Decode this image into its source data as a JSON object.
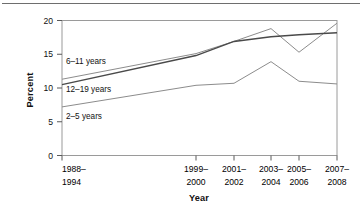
{
  "figure": {
    "name": "obesity-prevalence-line-chart",
    "top_rule": true,
    "background_color": "#ffffff"
  },
  "axes": {
    "x_title": "Year",
    "y_title": "Percent",
    "y_ticks": [
      "0",
      "5",
      "10",
      "15",
      "20"
    ],
    "x_ticks": [
      {
        "line1": "1988–",
        "line2": "1994"
      },
      {
        "line1": "1999–",
        "line2": "2000"
      },
      {
        "line1": "2001–",
        "line2": "2002"
      },
      {
        "line1": "2003–",
        "line2": "2004"
      },
      {
        "line1": "2005–",
        "line2": "2006"
      },
      {
        "line1": "2007–",
        "line2": "2008"
      }
    ]
  },
  "series_labels": {
    "s6_11": "6–11 years",
    "s12_19": "12–19 years",
    "s2_5": "2–5 years"
  },
  "chart_data": {
    "type": "line",
    "title": "",
    "xlabel": "Year",
    "ylabel": "Percent",
    "ylim": [
      0,
      20
    ],
    "yticks": [
      0,
      5,
      10,
      15,
      20
    ],
    "grid": false,
    "legend": "inline-labels-left",
    "categories": [
      "1988–1994",
      "1999–2000",
      "2001–2002",
      "2003–2004",
      "2005–2006",
      "2007–2008"
    ],
    "x_positions": [
      0,
      6.7,
      8.6,
      10.45,
      11.85,
      13.7
    ],
    "series": [
      {
        "name": "6–11 years",
        "color": "#8c8c8c",
        "values": [
          11.3,
          15.1,
          16.9,
          18.8,
          15.3,
          19.6
        ]
      },
      {
        "name": "12–19 years",
        "color": "#4a4a4a",
        "values": [
          10.5,
          14.8,
          16.9,
          17.6,
          17.9,
          18.2
        ]
      },
      {
        "name": "2–5 years",
        "color": "#8c8c8c",
        "values": [
          7.2,
          10.4,
          10.7,
          13.9,
          11.0,
          10.6
        ]
      }
    ]
  }
}
